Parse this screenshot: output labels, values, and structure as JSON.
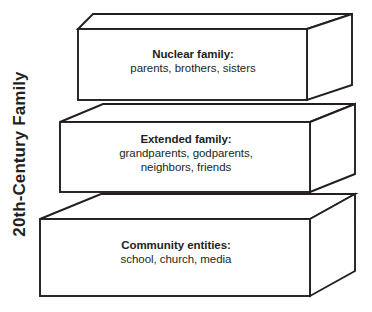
{
  "figure": {
    "axis_label": "20th-Century Family",
    "background_color": "#ffffff",
    "line_color": "#231f20",
    "text_color": "#231f20"
  },
  "layers": [
    {
      "id": "nuclear",
      "title": "Nuclear family:",
      "detail": "parents, brothers, sisters",
      "position": "top"
    },
    {
      "id": "extended",
      "title": "Extended family:",
      "detail_line_1": "grandparents, godparents,",
      "detail_line_2": "neighbors, friends",
      "position": "middle"
    },
    {
      "id": "community",
      "title": "Community entities:",
      "detail": "school, church, media",
      "position": "bottom"
    }
  ]
}
